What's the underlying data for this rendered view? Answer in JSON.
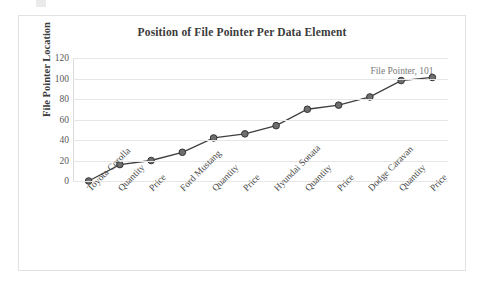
{
  "chart_data": {
    "type": "line",
    "title": "Position of File Pointer Per Data Element",
    "xlabel": "",
    "ylabel": "File Pointer Location",
    "categories": [
      "Toyota Corolla",
      "Quantity",
      "Price",
      "Ford Mustang",
      "Quantity",
      "Price",
      "Hyundai Sonata",
      "Quantity",
      "Price",
      "Dodge Caravan",
      "Quantity",
      "Price"
    ],
    "values": [
      0,
      16,
      20,
      28,
      42,
      46,
      54,
      70,
      74,
      82,
      98,
      101
    ],
    "series": [
      {
        "name": "File Pointer",
        "values": [
          0,
          16,
          20,
          28,
          42,
          46,
          54,
          70,
          74,
          82,
          98,
          101
        ]
      }
    ],
    "ylim": [
      0,
      120
    ],
    "yticks": [
      0,
      20,
      40,
      60,
      80,
      100,
      120
    ],
    "ytick_labels": [
      "0",
      "20",
      "40",
      "60",
      "80",
      "100",
      "120"
    ],
    "grid": true,
    "legend": false,
    "annotations": [
      {
        "text": "File Pointer, 101",
        "series": "File Pointer",
        "category": "Price",
        "value": 101
      }
    ],
    "colors": {
      "line": "#3f3f3f",
      "marker_fill": "#6e6e6e",
      "marker_stroke": "#333333",
      "gridline": "#e6e6e6",
      "title_text": "#3b3b3b",
      "tick_text": "#595959",
      "annotation_text": "#7a7a7a",
      "border": "#e2e2e2",
      "background": "#ffffff"
    }
  }
}
